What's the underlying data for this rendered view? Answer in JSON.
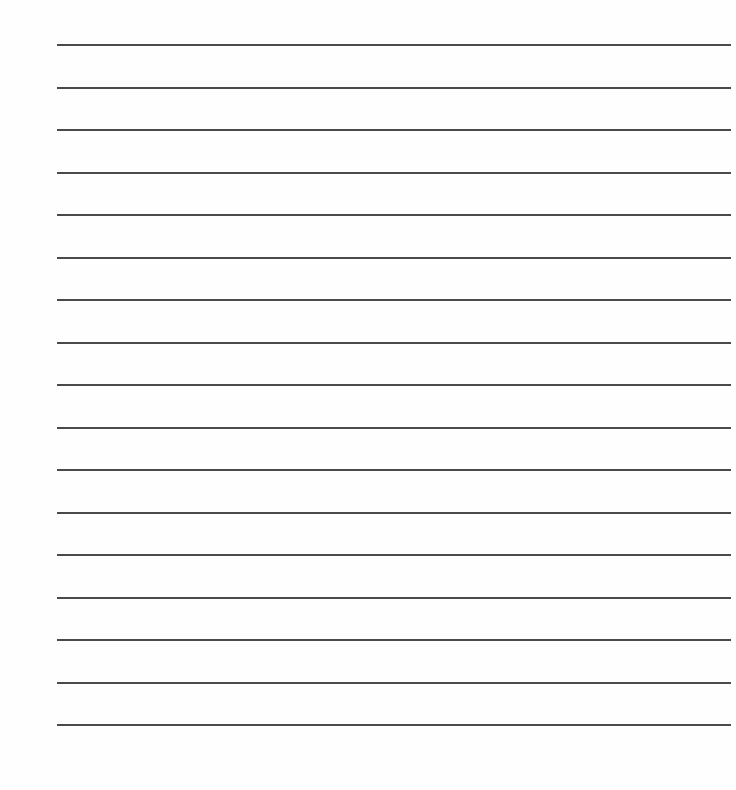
{
  "sheet": {
    "type": "lined-paper",
    "background": "#fefefe",
    "line_color": "#4a4a4a",
    "line_count": 17,
    "line_left": 57,
    "line_right": 731,
    "first_line_y": 44,
    "line_spacing": 42.5
  }
}
